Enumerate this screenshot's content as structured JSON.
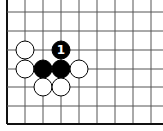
{
  "diagram": {
    "type": "go-board-fragment",
    "grid": {
      "x_lines": [
        7,
        25,
        43,
        61,
        79,
        97,
        115,
        133,
        151
      ],
      "y_lines": [
        12,
        31,
        50,
        69,
        87,
        106,
        124
      ],
      "thick_edges": [
        "left",
        "bottom"
      ],
      "line_color": "#555555",
      "edge_color": "#111111"
    },
    "stones": [
      {
        "color": "white",
        "x": 25,
        "y": 50,
        "label": ""
      },
      {
        "color": "white",
        "x": 25,
        "y": 69,
        "label": ""
      },
      {
        "color": "black",
        "x": 43,
        "y": 69,
        "label": ""
      },
      {
        "color": "black",
        "x": 61,
        "y": 69,
        "label": ""
      },
      {
        "color": "black",
        "x": 61,
        "y": 50,
        "label": "1"
      },
      {
        "color": "white",
        "x": 79,
        "y": 69,
        "label": ""
      },
      {
        "color": "white",
        "x": 43,
        "y": 87,
        "label": ""
      },
      {
        "color": "white",
        "x": 61,
        "y": 87,
        "label": ""
      }
    ],
    "stone_radius": 9
  }
}
